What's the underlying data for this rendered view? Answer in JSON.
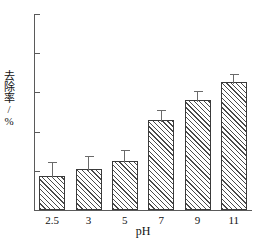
{
  "chart_data": {
    "type": "bar",
    "title": "",
    "xlabel": "pH",
    "ylabel": "去除率/%",
    "categories": [
      "2.5",
      "3",
      "5",
      "7",
      "9",
      "11"
    ],
    "values": [
      17.5,
      21,
      25,
      46,
      56,
      65.5
    ],
    "errors": [
      6.5,
      6,
      5,
      4.5,
      4,
      3.5
    ],
    "ylim": [
      0,
      100
    ],
    "yticks": [
      0,
      20,
      40,
      60,
      80,
      100
    ],
    "ytick_labels": [
      "0",
      "20",
      "40",
      "60",
      "80",
      "100"
    ],
    "grid": false,
    "legend": null,
    "bar_fill": "hatch-diagonal",
    "colors": {
      "bar_edge": "#3a3a3a",
      "hatch": "#4a4a4a",
      "axis": "#5a5a5a",
      "text": "#111111",
      "background": "#ffffff"
    }
  },
  "axes": {
    "x_title": "pH",
    "y_title": "去除率/%"
  }
}
